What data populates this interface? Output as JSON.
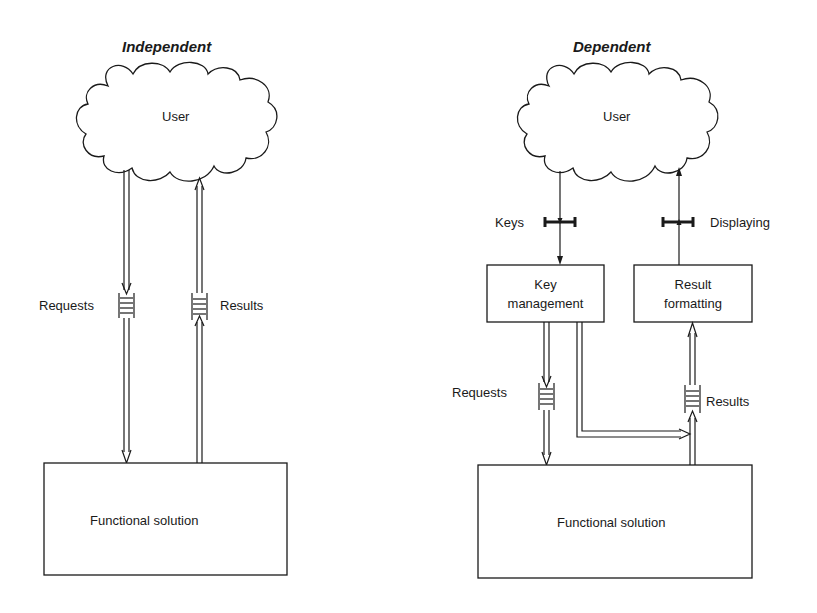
{
  "panels": {
    "independent": {
      "title": "Independent",
      "user_label": "User",
      "requests_label": "Requests",
      "results_label": "Results",
      "solution_label": "Functional solution"
    },
    "dependent": {
      "title": "Dependent",
      "user_label": "User",
      "keys_label": "Keys",
      "displaying_label": "Displaying",
      "key_management_line1": "Key",
      "key_management_line2": "management",
      "result_formatting_line1": "Result",
      "result_formatting_line2": "formatting",
      "requests_label": "Requests",
      "results_label": "Results",
      "solution_label": "Functional solution"
    }
  },
  "icons": {
    "cloud": "cloud-shape",
    "buffer": "double-pipe-buffer",
    "interface": "i-beam-connector"
  }
}
